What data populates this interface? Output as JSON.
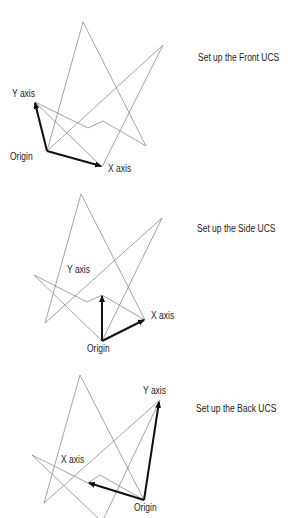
{
  "colors": {
    "background": "#ffffff",
    "wireframe": "#8c8c8c",
    "axis_arrow": "#111111",
    "text": "#222222"
  },
  "panels": [
    {
      "caption": "Set up the Front UCS",
      "labels": {
        "y_axis": "Y axis",
        "x_axis": "X axis",
        "origin": "Origin"
      }
    },
    {
      "caption": "Set up the Side UCS",
      "labels": {
        "y_axis": "Y axis",
        "x_axis": "X axis",
        "origin": "Origin"
      }
    },
    {
      "caption": "Set up the Back UCS",
      "labels": {
        "y_axis": "Y axis",
        "x_axis": "X axis",
        "origin": "Origin"
      }
    }
  ]
}
